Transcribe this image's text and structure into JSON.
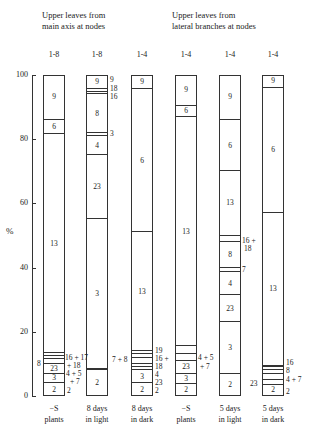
{
  "headers": {
    "main_axis": [
      "Upper leaves from",
      "main axis at nodes"
    ],
    "lateral": [
      "Upper leaves from",
      "lateral branches at nodes"
    ]
  },
  "axis": {
    "ylabel": "%",
    "ticks": [
      "100",
      "80",
      "60",
      "40",
      "20",
      "0"
    ]
  },
  "chart_data": {
    "type": "bar",
    "stacked": true,
    "title": "",
    "ylabel": "%",
    "ylim": [
      0,
      100
    ],
    "yticks": [
      0,
      20,
      40,
      60,
      80,
      100
    ],
    "group_headers": [
      "Upper leaves from main axis at nodes",
      "Upper leaves from lateral branches at nodes"
    ],
    "categories": [
      "-S plants",
      "8 days in light",
      "8 days in dark",
      "-S plants",
      "5 days in light",
      "5 days in dark"
    ],
    "node_ranges": [
      "1-8",
      "1-8",
      "1-4",
      "1-4",
      "1-4",
      "1-4"
    ],
    "bars": [
      {
        "label": "-S plants",
        "nodes": "1-8",
        "segments": [
          {
            "name": "2",
            "from": 0,
            "to": 4
          },
          {
            "name": "3",
            "from": 4,
            "to": 7
          },
          {
            "name": "23",
            "from": 7,
            "to": 10
          },
          {
            "name": "4+5+7",
            "from": 10,
            "to": 11.5
          },
          {
            "name": "8",
            "from": 11.5,
            "to": 12.5
          },
          {
            "name": "16+17+18",
            "from": 12.5,
            "to": 13.5
          },
          {
            "name": "13",
            "from": 13.5,
            "to": 81.5
          },
          {
            "name": "6",
            "from": 81.5,
            "to": 86
          },
          {
            "name": "9",
            "from": 86,
            "to": 100
          }
        ]
      },
      {
        "label": "8 days in light",
        "nodes": "1-8",
        "segments": [
          {
            "name": "2",
            "from": 0,
            "to": 8
          },
          {
            "name": "7+8",
            "from": 8,
            "to": 8.5
          },
          {
            "name": "3",
            "from": 8.5,
            "to": 55
          },
          {
            "name": "23",
            "from": 55,
            "to": 75
          },
          {
            "name": "4",
            "from": 75,
            "to": 81
          },
          {
            "name": "3",
            "from": 81,
            "to": 82
          },
          {
            "name": "8",
            "from": 82,
            "to": 94
          },
          {
            "name": "16",
            "from": 94,
            "to": 94.8
          },
          {
            "name": "18",
            "from": 94.8,
            "to": 95.5
          },
          {
            "name": "9",
            "from": 95.5,
            "to": 100
          }
        ]
      },
      {
        "label": "8 days in dark",
        "nodes": "1-4",
        "segments": [
          {
            "name": "2",
            "from": 0,
            "to": 4
          },
          {
            "name": "3",
            "from": 4,
            "to": 8
          },
          {
            "name": "23",
            "from": 8,
            "to": 9
          },
          {
            "name": "4",
            "from": 9,
            "to": 10
          },
          {
            "name": "7+8",
            "from": 10,
            "to": 12
          },
          {
            "name": "16+18",
            "from": 12,
            "to": 13
          },
          {
            "name": "19",
            "from": 13,
            "to": 14
          },
          {
            "name": "13",
            "from": 14,
            "to": 51
          },
          {
            "name": "6",
            "from": 51,
            "to": 95.5
          },
          {
            "name": "9",
            "from": 95.5,
            "to": 100
          }
        ]
      },
      {
        "label": "-S plants",
        "nodes": "1-4",
        "segments": [
          {
            "name": "2",
            "from": 0,
            "to": 3.7
          },
          {
            "name": "3",
            "from": 3.7,
            "to": 7
          },
          {
            "name": "23",
            "from": 7,
            "to": 11
          },
          {
            "name": "4+5+7",
            "from": 11,
            "to": 13
          },
          {
            "name": "8",
            "from": 13,
            "to": 15.5
          },
          {
            "name": "13",
            "from": 15.5,
            "to": 87
          },
          {
            "name": "6",
            "from": 87,
            "to": 90.5
          },
          {
            "name": "9",
            "from": 90.5,
            "to": 100
          }
        ]
      },
      {
        "label": "5 days in light",
        "nodes": "1-4",
        "segments": [
          {
            "name": "2",
            "from": 0,
            "to": 7
          },
          {
            "name": "3",
            "from": 7,
            "to": 23
          },
          {
            "name": "23",
            "from": 23,
            "to": 31.5
          },
          {
            "name": "4",
            "from": 31.5,
            "to": 38.5
          },
          {
            "name": "7",
            "from": 38.5,
            "to": 40
          },
          {
            "name": "8",
            "from": 40,
            "to": 48
          },
          {
            "name": "16+18",
            "from": 48,
            "to": 50
          },
          {
            "name": "13",
            "from": 50,
            "to": 70
          },
          {
            "name": "6",
            "from": 70,
            "to": 86
          },
          {
            "name": "9",
            "from": 86,
            "to": 100
          }
        ]
      },
      {
        "label": "5 days in dark",
        "nodes": "1-4",
        "segments": [
          {
            "name": "2",
            "from": 0,
            "to": 3.5
          },
          {
            "name": "3",
            "from": 3.5,
            "to": 5
          },
          {
            "name": "23",
            "from": 5,
            "to": 7
          },
          {
            "name": "4+7",
            "from": 7,
            "to": 8
          },
          {
            "name": "8",
            "from": 8,
            "to": 9
          },
          {
            "name": "16",
            "from": 9,
            "to": 9.5
          },
          {
            "name": "13",
            "from": 9.5,
            "to": 57
          },
          {
            "name": "6",
            "from": 57,
            "to": 96
          },
          {
            "name": "9",
            "from": 96,
            "to": 100
          }
        ]
      }
    ]
  },
  "bottom_labels": [
    [
      "−S",
      "plants"
    ],
    [
      "8 days",
      "in light"
    ],
    [
      "8 days",
      "in dark"
    ],
    [
      "−S",
      "plants"
    ],
    [
      "5 days",
      "in light"
    ],
    [
      "5 days",
      "in dark"
    ]
  ],
  "bar_x": [
    43,
    86,
    131,
    175,
    219,
    262
  ],
  "annotations": [
    {
      "text": "16 + 17",
      "x": 65,
      "y": 354
    },
    {
      "text": "+ 18",
      "x": 67,
      "y": 362
    },
    {
      "text": "8",
      "x": 37,
      "y": 360
    },
    {
      "text": "4 + 5",
      "x": 66,
      "y": 370
    },
    {
      "text": "+ 7",
      "x": 70,
      "y": 378
    },
    {
      "text": "2",
      "x": 67,
      "y": 387
    },
    {
      "text": "9",
      "x": 110,
      "y": 76
    },
    {
      "text": "18",
      "x": 110,
      "y": 85
    },
    {
      "text": "16",
      "x": 110,
      "y": 93
    },
    {
      "text": "3",
      "x": 110,
      "y": 130
    },
    {
      "text": "7 + 8",
      "x": 112,
      "y": 356
    },
    {
      "text": "19",
      "x": 155,
      "y": 347
    },
    {
      "text": "16 +",
      "x": 155,
      "y": 355
    },
    {
      "text": "18",
      "x": 155,
      "y": 363
    },
    {
      "text": "4",
      "x": 155,
      "y": 371
    },
    {
      "text": "23",
      "x": 155,
      "y": 379
    },
    {
      "text": "2",
      "x": 155,
      "y": 387
    },
    {
      "text": "4 + 5",
      "x": 198,
      "y": 354
    },
    {
      "text": "+ 7",
      "x": 200,
      "y": 363
    },
    {
      "text": "16 +",
      "x": 242,
      "y": 237
    },
    {
      "text": "18",
      "x": 244,
      "y": 245
    },
    {
      "text": "7",
      "x": 242,
      "y": 266
    },
    {
      "text": "16",
      "x": 286,
      "y": 359
    },
    {
      "text": "8",
      "x": 286,
      "y": 367
    },
    {
      "text": "4 + 7",
      "x": 286,
      "y": 376
    },
    {
      "text": "2",
      "x": 286,
      "y": 388
    },
    {
      "text": "23",
      "x": 250,
      "y": 380
    }
  ]
}
